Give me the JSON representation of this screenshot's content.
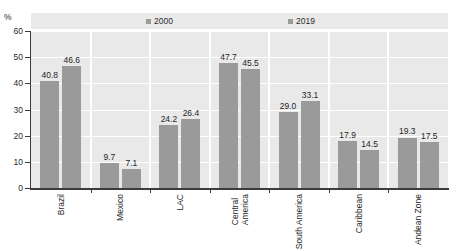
{
  "chart_data": {
    "type": "bar",
    "title": "",
    "xlabel": "",
    "ylabel": "%",
    "ylim": [
      0,
      60
    ],
    "yticks": [
      0,
      10,
      20,
      30,
      40,
      50,
      60
    ],
    "grid": true,
    "legend_position": "top",
    "categories": [
      "Brazil",
      "Mexico",
      "LAC",
      "Central America",
      "South America",
      "Caribbean",
      "Andean Zone"
    ],
    "series": [
      {
        "name": "2000",
        "color": "#9a9a9a",
        "values": [
          40.8,
          9.7,
          24.2,
          47.7,
          29.0,
          17.9,
          19.3
        ],
        "labels": [
          "40.8",
          "9.7",
          "24.2",
          "47.7",
          "29.0",
          "17.9",
          "19.3"
        ]
      },
      {
        "name": "2019",
        "color": "#9a9a9a",
        "values": [
          46.6,
          7.1,
          26.4,
          45.5,
          33.1,
          14.5,
          17.5
        ],
        "labels": [
          "46.6",
          "7.1",
          "26.4",
          "45.5",
          "33.1",
          "14.5",
          "17.5"
        ]
      }
    ]
  },
  "axis": {
    "unit": "%",
    "tick_labels": [
      "60",
      "50",
      "40",
      "30",
      "20",
      "10",
      "0"
    ]
  },
  "category_labels": [
    {
      "line1": "Brazil",
      "line2": ""
    },
    {
      "line1": "Mexico",
      "line2": ""
    },
    {
      "line1": "LAC",
      "line2": ""
    },
    {
      "line1": "Central",
      "line2": "America"
    },
    {
      "line1": "South America",
      "line2": ""
    },
    {
      "line1": "Caribbean",
      "line2": ""
    },
    {
      "line1": "Andean Zone",
      "line2": ""
    }
  ],
  "legend": {
    "entries": [
      {
        "label": "2000"
      },
      {
        "label": "2019"
      }
    ]
  }
}
